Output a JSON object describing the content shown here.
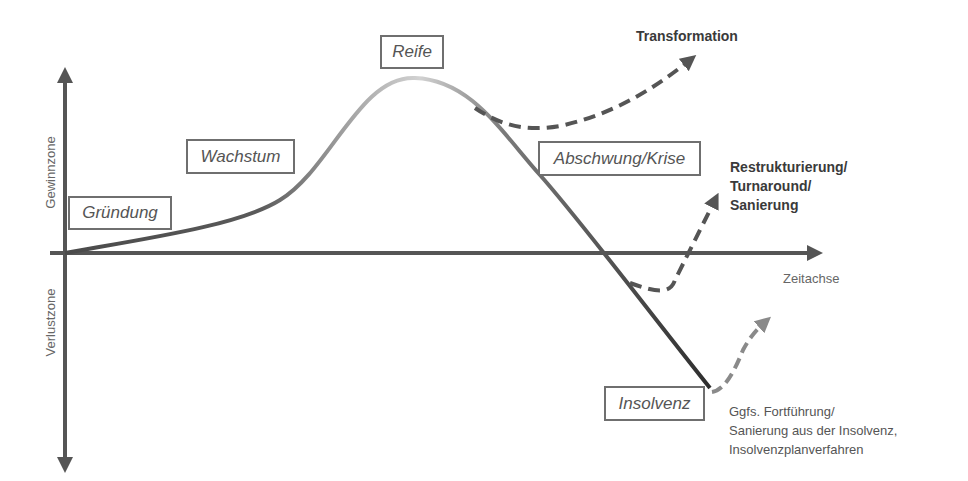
{
  "diagram": {
    "type": "company-lifecycle-curve",
    "axes": {
      "y_positive_label": "Gewinnzone",
      "y_negative_label": "Verlustzone",
      "x_label": "Zeitachse"
    },
    "phases": [
      {
        "id": "gruendung",
        "label": "Gründung"
      },
      {
        "id": "wachstum",
        "label": "Wachstum"
      },
      {
        "id": "reife",
        "label": "Reife"
      },
      {
        "id": "abschwung",
        "label": "Abschwung/Krise"
      },
      {
        "id": "insolvenz",
        "label": "Insolvenz"
      }
    ],
    "outcomes": {
      "transformation": "Transformation",
      "restructuring": [
        "Restrukturierung/",
        "Turnaround/",
        "Sanierung"
      ],
      "insolvency_continuation": [
        "Ggfs. Fortführung/",
        "Sanierung aus der Insolvenz,",
        "Insolvenzplanverfahren"
      ]
    },
    "colors": {
      "axis": "#555555",
      "curve_dark": "#4a4a4a",
      "curve_light": "#c8c8c8",
      "dashed": "#555555",
      "dashed_light": "#8a8a8a",
      "box_border": "#6f6f6f"
    }
  }
}
